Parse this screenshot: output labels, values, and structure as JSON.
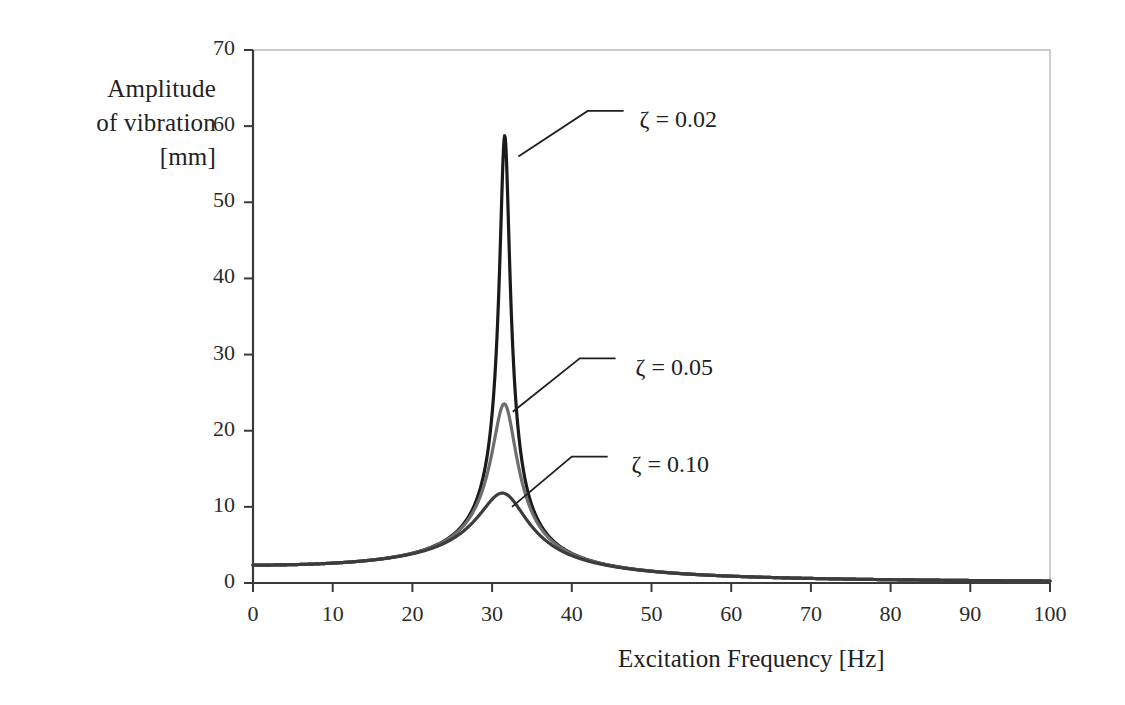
{
  "chart_data": {
    "type": "line",
    "title": "",
    "xlabel": "Excitation Frequency [Hz]",
    "ylabel_lines": [
      "Amplitude",
      "of vibration",
      "[mm]"
    ],
    "ylabel": "Amplitude of vibration [mm]",
    "xlim": [
      0,
      100
    ],
    "ylim": [
      0,
      70
    ],
    "xticks": [
      0,
      10,
      20,
      30,
      40,
      50,
      60,
      70,
      80,
      90,
      100
    ],
    "yticks": [
      0,
      10,
      20,
      30,
      40,
      50,
      60,
      70
    ],
    "xtick_labels": [
      "0",
      "10",
      "20",
      "30",
      "40",
      "50",
      "60",
      "70",
      "80",
      "90",
      "100"
    ],
    "ytick_labels": [
      "0",
      "10",
      "20",
      "30",
      "40",
      "50",
      "60",
      "70"
    ],
    "grid": false,
    "legend_position": "inline-annotations",
    "static_deflection_mm": 2.35,
    "natural_frequency_hz": 31.6,
    "series": [
      {
        "name": "zeta = 0.02",
        "label": "ζ = 0.02",
        "zeta": 0.02,
        "color": "#1a1a1a",
        "peak_x": 31.6,
        "peak_y": 63.0,
        "annotation_x": 48.5,
        "annotation_y": 60.5,
        "x": [
          0,
          5,
          10,
          15,
          20,
          22,
          24,
          26,
          28,
          29,
          30,
          31,
          31.6,
          32,
          33,
          34,
          36,
          38,
          40,
          45,
          50,
          60,
          70,
          80,
          90,
          100
        ],
        "values": [
          2.35,
          2.41,
          2.59,
          2.95,
          3.67,
          4.19,
          5.0,
          6.4,
          9.4,
          12.4,
          18.4,
          38.5,
          63.0,
          44.0,
          17.0,
          10.2,
          5.6,
          3.8,
          2.9,
          1.85,
          1.4,
          1.0,
          0.85,
          0.78,
          0.75,
          0.72
        ]
      },
      {
        "name": "zeta = 0.05",
        "label": "ζ = 0.05",
        "zeta": 0.05,
        "color": "#6e6e6e",
        "peak_x": 31.6,
        "peak_y": 25.7,
        "annotation_x": 48.0,
        "annotation_y": 28.0,
        "x": [
          0,
          5,
          10,
          15,
          20,
          22,
          24,
          26,
          28,
          29,
          30,
          31,
          31.6,
          32,
          33,
          34,
          36,
          38,
          40,
          45,
          50,
          60,
          70,
          80,
          90,
          100
        ],
        "values": [
          2.35,
          2.41,
          2.58,
          2.93,
          3.62,
          4.11,
          4.87,
          6.1,
          8.5,
          10.3,
          13.4,
          20.0,
          25.7,
          22.5,
          13.6,
          9.2,
          5.4,
          3.75,
          2.85,
          1.84,
          1.4,
          1.0,
          0.85,
          0.78,
          0.75,
          0.72
        ]
      },
      {
        "name": "zeta = 0.10",
        "label": "ζ = 0.10",
        "zeta": 0.1,
        "color": "#3c3c3c",
        "peak_x": 31.6,
        "peak_y": 12.9,
        "annotation_x": 47.5,
        "annotation_y": 15.3,
        "x": [
          0,
          5,
          10,
          15,
          20,
          22,
          24,
          26,
          28,
          29,
          30,
          31,
          31.6,
          32,
          33,
          34,
          36,
          38,
          40,
          45,
          50,
          60,
          70,
          80,
          90,
          100
        ],
        "values": [
          2.35,
          2.4,
          2.56,
          2.88,
          3.48,
          3.9,
          4.5,
          5.4,
          6.9,
          7.9,
          9.2,
          11.5,
          12.9,
          12.4,
          9.9,
          7.9,
          5.1,
          3.6,
          2.75,
          1.81,
          1.39,
          1.0,
          0.85,
          0.78,
          0.75,
          0.72
        ]
      }
    ]
  },
  "axes": {
    "frame_color": "#b9b9b9",
    "axis_color": "#3a3a3a"
  }
}
